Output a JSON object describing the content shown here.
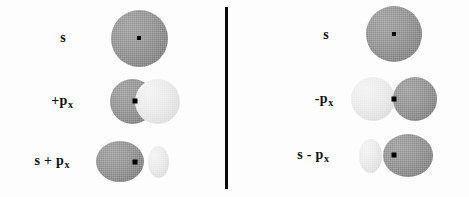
{
  "figure": {
    "background_color": "#fdfdfd",
    "width": 469,
    "height": 197,
    "colors": {
      "dark_lobe": "#828282",
      "light_lobe": "#e2e2e2",
      "nucleus": "#000000",
      "divider": "#0a0a0a",
      "text": "#111111"
    },
    "divider": {
      "name": "panel-divider",
      "orientation": "vertical",
      "x": 226,
      "y_top": 7,
      "y_bottom": 189,
      "thickness": 3
    }
  },
  "panels": [
    {
      "id": "left",
      "rows": [
        {
          "id": "left-s",
          "label_prefix": "s",
          "label_sub": "",
          "label_text": "s",
          "orbital": "s",
          "lobes": [
            {
              "shade": "dark",
              "shape": "circle"
            }
          ]
        },
        {
          "id": "left-plus-px",
          "label_prefix": "+p",
          "label_sub": "x",
          "label_text": "+px",
          "orbital": "p_x positive",
          "lobes": [
            {
              "shade": "dark",
              "shape": "circle"
            },
            {
              "shade": "light",
              "shape": "circle"
            }
          ]
        },
        {
          "id": "left-s-plus-px",
          "label_prefix": "s + p",
          "label_sub": "x",
          "label_text": "s + px",
          "orbital": "s plus p_x hybrid",
          "lobes": [
            {
              "shade": "dark",
              "shape": "large-ellipse"
            },
            {
              "shade": "light",
              "shape": "small-ellipse"
            }
          ]
        }
      ]
    },
    {
      "id": "right",
      "rows": [
        {
          "id": "right-s",
          "label_prefix": "s",
          "label_sub": "",
          "label_text": "s",
          "orbital": "s",
          "lobes": [
            {
              "shade": "dark",
              "shape": "circle"
            }
          ]
        },
        {
          "id": "right-minus-px",
          "label_prefix": "-p",
          "label_sub": "x",
          "label_text": "-px",
          "orbital": "p_x negative",
          "lobes": [
            {
              "shade": "light",
              "shape": "circle"
            },
            {
              "shade": "dark",
              "shape": "circle"
            }
          ]
        },
        {
          "id": "right-s-minus-px",
          "label_prefix": "s - p",
          "label_sub": "x",
          "label_text": "s - px",
          "orbital": "s minus p_x hybrid",
          "lobes": [
            {
              "shade": "light",
              "shape": "small-ellipse"
            },
            {
              "shade": "dark",
              "shape": "large-ellipse"
            }
          ]
        }
      ]
    }
  ],
  "labels": {
    "left_s": "s",
    "left_px_prefix": "+p",
    "left_px_sub": "x",
    "left_spx_prefix": "s + p",
    "left_spx_sub": "x",
    "right_s": "s",
    "right_px_prefix": "-p",
    "right_px_sub": "x",
    "right_spx_prefix": "s - p",
    "right_spx_sub": "x"
  }
}
